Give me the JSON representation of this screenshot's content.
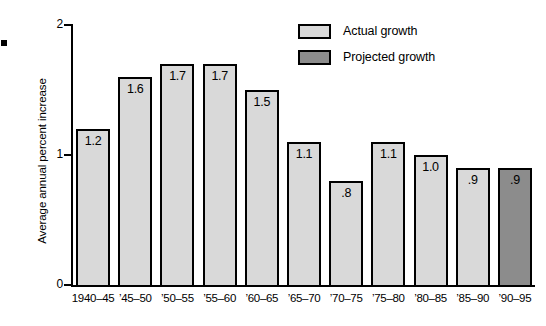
{
  "chart_data": {
    "type": "bar",
    "title": "",
    "xlabel": "",
    "ylabel": "Average annual percent increase",
    "ylim": [
      0,
      2
    ],
    "yticks": [
      "0",
      "1",
      "2"
    ],
    "grid": false,
    "legend_position": "top-right",
    "categories": [
      "1940–45",
      "’45–50",
      "’50–55",
      "’55–60",
      "’60–65",
      "’65–70",
      "’70–75",
      "’75–80",
      "’80–85",
      "’85–90",
      "’90–95"
    ],
    "values": [
      1.2,
      1.6,
      1.7,
      1.7,
      1.5,
      1.1,
      0.8,
      1.1,
      1.0,
      0.9,
      0.9
    ],
    "value_labels": [
      "1.2",
      "1.6",
      "1.7",
      "1.7",
      "1.5",
      "1.1",
      ".8",
      "1.1",
      "1.0",
      ".9",
      ".9"
    ],
    "series_kind": [
      "actual",
      "actual",
      "actual",
      "actual",
      "actual",
      "actual",
      "actual",
      "actual",
      "actual",
      "actual",
      "projected"
    ],
    "legend": [
      {
        "label": "Actual growth",
        "key": "actual",
        "color": "#d9d9d9"
      },
      {
        "label": "Projected growth",
        "key": "projected",
        "color": "#8c8c8c"
      }
    ]
  },
  "colors": {
    "actual_fill": "#d9d9d9",
    "projected_fill": "#8c8c8c",
    "outline": "#000000",
    "background": "#ffffff"
  }
}
